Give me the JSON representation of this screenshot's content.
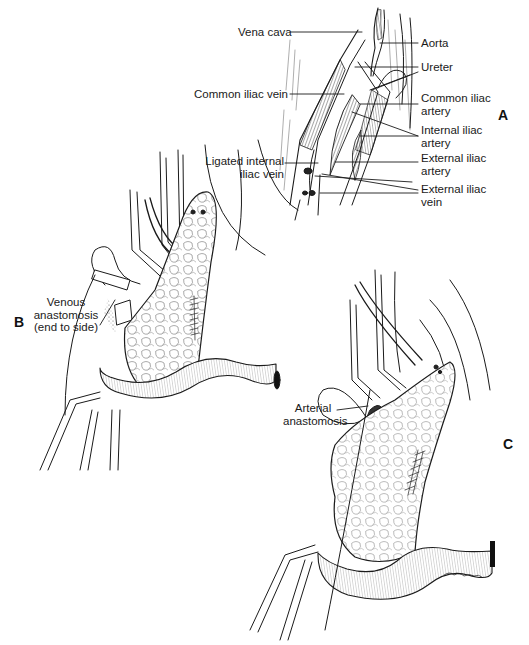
{
  "figure": {
    "panels": [
      {
        "id": "A",
        "letter": "A",
        "labels": {
          "vena_cava": "Vena cava",
          "aorta": "Aorta",
          "ureter": "Ureter",
          "common_iliac_vein": "Common iliac vein",
          "common_iliac_artery_1": "Common iliac",
          "common_iliac_artery_2": "artery",
          "internal_iliac_artery_1": "Internal iliac",
          "internal_iliac_artery_2": "artery",
          "ligated_internal_iliac_vein_1": "Ligated internal",
          "ligated_internal_iliac_vein_2": "iliac vein",
          "external_iliac_artery_1": "External iliac",
          "external_iliac_artery_2": "artery",
          "external_iliac_vein_1": "External iliac",
          "external_iliac_vein_2": "vein"
        }
      },
      {
        "id": "B",
        "letter": "B",
        "labels": {
          "venous_1": "Venous",
          "venous_2": "anastomosis",
          "venous_3": "(end to side)"
        }
      },
      {
        "id": "C",
        "letter": "C",
        "labels": {
          "arterial_1": "Arterial",
          "arterial_2": "anastomosis"
        }
      }
    ],
    "colors": {
      "ink": "#1a1a1a",
      "paper": "#ffffff"
    }
  }
}
